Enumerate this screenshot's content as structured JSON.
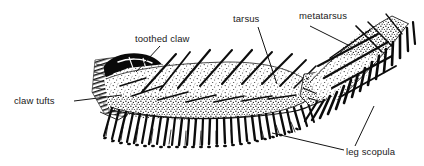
{
  "figure": {
    "background_color": "#ffffff",
    "ink_color": "#111111",
    "labels": [
      {
        "id": "claw-tufts",
        "text": "claw tufts",
        "x": 14,
        "y": 104,
        "anchor": "start",
        "leader": "M 74 101 L 122 95"
      },
      {
        "id": "toothed-claw",
        "text": "toothed claw",
        "x": 135,
        "y": 42,
        "anchor": "start",
        "leader": "M 160 46 L 136 72"
      },
      {
        "id": "tarsus",
        "text": "tarsus",
        "x": 233,
        "y": 22,
        "anchor": "start",
        "leader": "M 258 27 L 277 84"
      },
      {
        "id": "metatarsus",
        "text": "metatarsus",
        "x": 299,
        "y": 19,
        "anchor": "start",
        "leader": "M 310 26 L 350 46"
      },
      {
        "id": "leg-scopula",
        "text": "leg scopula",
        "x": 346,
        "y": 155,
        "anchor": "start",
        "leader": "M 355 146 L 374 106"
      }
    ],
    "extra_leaders": [
      {
        "id": "scopula-lower-leader",
        "path": "M 272 133 L 344 150"
      }
    ]
  }
}
